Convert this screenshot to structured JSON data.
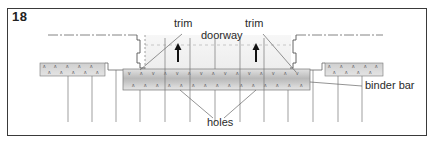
{
  "figure": {
    "number": "18",
    "labels": {
      "trim_left": "trim",
      "trim_right": "trim",
      "doorway": "doorway",
      "binder_bar": "binder bar",
      "holes": "holes"
    }
  },
  "colors": {
    "line": "#555555",
    "frame": "#3a3a3a",
    "strip_fill": "#d6d6d6",
    "binder_fill": "#cfcfcf",
    "binder_center": "#b8b8b8",
    "doorway_shade": "#f1f1f1",
    "arrow": "#111111"
  }
}
